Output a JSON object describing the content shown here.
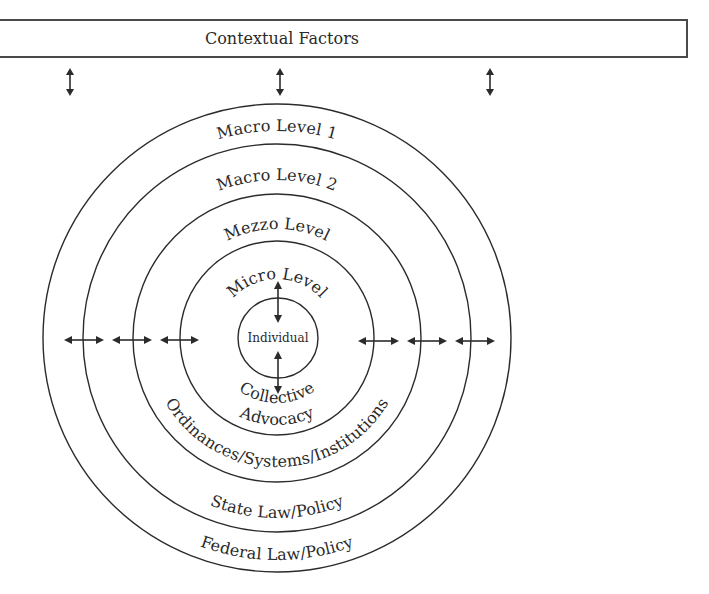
{
  "header": {
    "title": "Contextual Factors"
  },
  "rings": [
    {
      "id": "macro-level-1",
      "top_label": "Macro Level 1",
      "bottom_label": "Federal Law/Policy"
    },
    {
      "id": "macro-level-2",
      "top_label": "Macro Level 2",
      "bottom_label": "State Law/Policy"
    },
    {
      "id": "mezzo-level",
      "top_label": "Mezzo Level",
      "bottom_label": "Ordinances/Systems/Institutions"
    },
    {
      "id": "micro-level",
      "top_label": "Micro Level",
      "bottom_label_line1": "Collective",
      "bottom_label_line2": "Advocacy"
    }
  ],
  "core": {
    "label": "Individual"
  },
  "connectors": {
    "top_vertical_count": 3,
    "left_horizontal_count": 3,
    "right_horizontal_count": 3,
    "inner_vertical_count": 2
  },
  "colors": {
    "stroke": "#2b2b2b",
    "text": "#2a2a2a",
    "background": "#ffffff"
  }
}
